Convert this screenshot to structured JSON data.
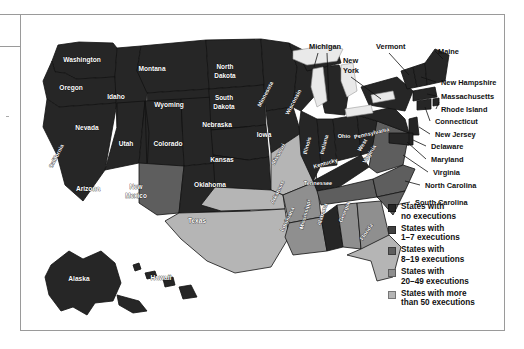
{
  "figure": {
    "type": "choropleth-map",
    "region": "United States",
    "frame_border_color": "#9a9a9a"
  },
  "palette": {
    "none": "#262626",
    "low": "#3f3f3f",
    "mid": "#5e5e5e",
    "high": "#8f8f8f",
    "highest": "#b5b5b5",
    "water": "#e9e9e9",
    "border": "#111111",
    "label_light": "#ffffff",
    "label_dark": "#111111"
  },
  "legend": {
    "items": [
      {
        "swatch": "#262626",
        "line1": "States with",
        "line2": "no executions"
      },
      {
        "swatch": "#3f3f3f",
        "line1": "States with",
        "line2": "1–7 executions"
      },
      {
        "swatch": "#5e5e5e",
        "line1": "States with",
        "line2": "8–19 executions"
      },
      {
        "swatch": "#8f8f8f",
        "line1": "States with",
        "line2": "20–49 executions"
      },
      {
        "swatch": "#b5b5b5",
        "line1": "States with more",
        "line2": "than 50 executions"
      }
    ]
  },
  "inside_labels": [
    {
      "name": "Washington",
      "x": 61,
      "y": 47,
      "rot": 0,
      "cls": "slab"
    },
    {
      "name": "Montana",
      "x": 131,
      "y": 56,
      "rot": 0,
      "cls": "slab"
    },
    {
      "name": "North",
      "x": 204,
      "y": 54,
      "rot": 0,
      "cls": "slab two"
    },
    {
      "name": "Dakota",
      "x": 204,
      "y": 63,
      "rot": 0,
      "cls": "slab two"
    },
    {
      "name": "Oregon",
      "x": 50,
      "y": 75,
      "rot": 0,
      "cls": "slab"
    },
    {
      "name": "Idaho",
      "x": 95,
      "y": 84,
      "rot": 0,
      "cls": "slab"
    },
    {
      "name": "Wyoming",
      "x": 148,
      "y": 92,
      "rot": 0,
      "cls": "slab"
    },
    {
      "name": "South",
      "x": 203,
      "y": 85,
      "rot": 0,
      "cls": "slab two"
    },
    {
      "name": "Dakota",
      "x": 203,
      "y": 94,
      "rot": 0,
      "cls": "slab two"
    },
    {
      "name": "Minnesota",
      "x": 246,
      "y": 80,
      "rot": -62,
      "cls": "slab sm"
    },
    {
      "name": "Nevada",
      "x": 66,
      "y": 115,
      "rot": 0,
      "cls": "slab"
    },
    {
      "name": "Nebraska",
      "x": 196,
      "y": 112,
      "rot": 0,
      "cls": "slab"
    },
    {
      "name": "Wisconsin",
      "x": 274,
      "y": 88,
      "rot": -62,
      "cls": "slab sm"
    },
    {
      "name": "Iowa",
      "x": 243,
      "y": 122,
      "rot": 0,
      "cls": "slab"
    },
    {
      "name": "California",
      "x": 37,
      "y": 142,
      "rot": -62,
      "cls": "slab sm"
    },
    {
      "name": "Utah",
      "x": 105,
      "y": 131,
      "rot": 0,
      "cls": "slab"
    },
    {
      "name": "Colorado",
      "x": 147,
      "y": 131,
      "rot": 0,
      "cls": "slab"
    },
    {
      "name": "Kansas",
      "x": 201,
      "y": 147,
      "rot": 0,
      "cls": "slab"
    },
    {
      "name": "Missouri",
      "x": 259,
      "y": 140,
      "rot": -62,
      "cls": "slab sm"
    },
    {
      "name": "Illinois",
      "x": 288,
      "y": 131,
      "rot": -75,
      "cls": "slab sm"
    },
    {
      "name": "Indiana",
      "x": 305,
      "y": 130,
      "rot": -75,
      "cls": "slab sm"
    },
    {
      "name": "Ohio",
      "x": 323,
      "y": 123,
      "rot": 0,
      "cls": "slab sm"
    },
    {
      "name": "Kentucky",
      "x": 305,
      "y": 150,
      "rot": -16,
      "cls": "slab sm"
    },
    {
      "name": "West",
      "x": 343,
      "y": 131,
      "rot": -58,
      "cls": "slab sm"
    },
    {
      "name": "Virginia",
      "x": 350,
      "y": 140,
      "rot": -58,
      "cls": "slab sm"
    },
    {
      "name": "Pennsylvania",
      "x": 351,
      "y": 120,
      "rot": -13,
      "cls": "slab sm"
    },
    {
      "name": "Arizona",
      "x": 67,
      "y": 176,
      "rot": 0,
      "cls": "slab"
    },
    {
      "name": "New",
      "x": 115,
      "y": 174,
      "rot": 0,
      "cls": "slab two"
    },
    {
      "name": "Mexico",
      "x": 115,
      "y": 183,
      "rot": 0,
      "cls": "slab two"
    },
    {
      "name": "Oklahoma",
      "x": 189,
      "y": 172,
      "rot": 0,
      "cls": "slab"
    },
    {
      "name": "Arkansas",
      "x": 258,
      "y": 178,
      "rot": -64,
      "cls": "slab sm"
    },
    {
      "name": "Tennessee",
      "x": 297,
      "y": 170,
      "rot": 0,
      "cls": "slab sm"
    },
    {
      "name": "Texas",
      "x": 176,
      "y": 208,
      "rot": 0,
      "cls": "slab"
    },
    {
      "name": "Louisiana",
      "x": 268,
      "y": 205,
      "rot": -64,
      "cls": "slab sm"
    },
    {
      "name": "Mississippi",
      "x": 286,
      "y": 200,
      "rot": -75,
      "cls": "slab sm"
    },
    {
      "name": "Alabama",
      "x": 303,
      "y": 200,
      "rot": -72,
      "cls": "slab sm"
    },
    {
      "name": "Georgia",
      "x": 325,
      "y": 198,
      "rot": -68,
      "cls": "slab sm"
    },
    {
      "name": "Florida",
      "x": 347,
      "y": 218,
      "rot": -56,
      "cls": "slab sm"
    },
    {
      "name": "Alaska",
      "x": 58,
      "y": 266,
      "rot": 0,
      "cls": "slab"
    },
    {
      "name": "Hawaii",
      "x": 140,
      "y": 265,
      "rot": 0,
      "cls": "slab"
    }
  ],
  "callout_labels": [
    {
      "name": "Michigan",
      "x": 288,
      "y": 34
    },
    {
      "name": "Vermont",
      "x": 355,
      "y": 34
    },
    {
      "name": "Maine",
      "x": 417,
      "y": 39
    },
    {
      "name": "New",
      "x": 322,
      "y": 48
    },
    {
      "name": "York",
      "x": 322,
      "y": 58
    },
    {
      "name": "New Hampshire",
      "x": 420,
      "y": 70
    },
    {
      "name": "Massachusetts",
      "x": 420,
      "y": 84
    },
    {
      "name": "Rhode Island",
      "x": 420,
      "y": 97
    },
    {
      "name": "Connecticut",
      "x": 414,
      "y": 109
    },
    {
      "name": "New Jersey",
      "x": 414,
      "y": 122
    },
    {
      "name": "Delaware",
      "x": 410,
      "y": 134
    },
    {
      "name": "Maryland",
      "x": 410,
      "y": 147
    },
    {
      "name": "Virginia",
      "x": 412,
      "y": 160
    },
    {
      "name": "North Carolina",
      "x": 404,
      "y": 173
    },
    {
      "name": "South Carolina",
      "x": 394,
      "y": 190
    }
  ]
}
